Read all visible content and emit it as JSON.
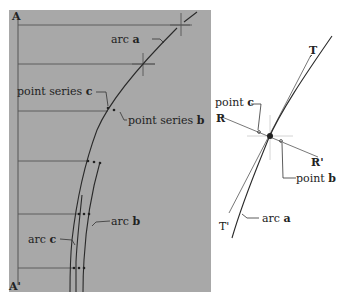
{
  "colors": {
    "panel_bg": "#a8a8a8",
    "page_bg": "#ffffff",
    "line": "#2a2a2a",
    "guide": "#555555",
    "light_line": "#cfcfcf"
  },
  "left_panel": {
    "top_label": "A",
    "bottom_label": "A'",
    "labels": {
      "arc_a_prefix": "arc ",
      "arc_a_letter": "a",
      "point_series_c_prefix": "point series ",
      "point_series_c_letter": "c",
      "point_series_b_prefix": "point series ",
      "point_series_b_letter": "b",
      "arc_b_prefix": "arc ",
      "arc_b_letter": "b",
      "arc_c_prefix": "arc ",
      "arc_c_letter": "c"
    }
  },
  "right_panel": {
    "labels": {
      "T": "T",
      "T_prime": "T'",
      "R": "R",
      "R_prime": "R'",
      "point_c_prefix": "point ",
      "point_c_letter": "c",
      "point_b_prefix": "point ",
      "point_b_letter": "b",
      "arc_a_prefix": "arc ",
      "arc_a_letter": "a"
    }
  }
}
